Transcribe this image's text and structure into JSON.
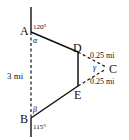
{
  "diagram": {
    "type": "geometry",
    "points": {
      "A": {
        "label": "A",
        "x": 31,
        "y": 32
      },
      "B": {
        "label": "B",
        "x": 31,
        "y": 118
      },
      "C": {
        "label": "C",
        "x": 108,
        "y": 68
      },
      "D": {
        "label": "D",
        "x": 78,
        "y": 52
      },
      "E": {
        "label": "E",
        "x": 78,
        "y": 86
      }
    },
    "angles": {
      "at_A_exterior": "120°",
      "at_A_interior": "α",
      "at_B_exterior": "115°",
      "at_B_interior": "β",
      "at_C": "γ"
    },
    "lengths": {
      "AB": "3 mi",
      "DC": "0.25 mi",
      "EC": "0.25 mi"
    },
    "colors": {
      "stroke": "#111111",
      "background": "#ffffff"
    }
  }
}
